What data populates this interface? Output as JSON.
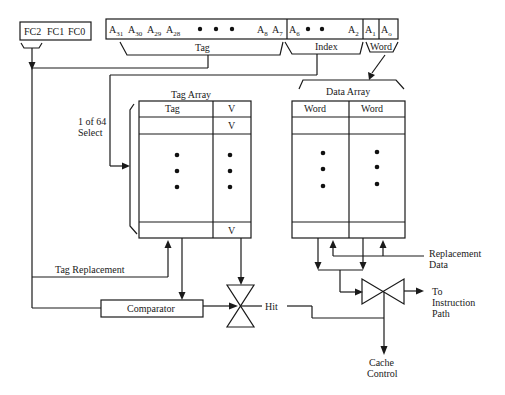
{
  "function_code": {
    "label": "FC2  FC1 FC0",
    "bits": [
      "FC2",
      "FC1",
      "FC0"
    ]
  },
  "address": {
    "tag_bits": {
      "a31": {
        "base": "A",
        "sub": "31"
      },
      "a30": {
        "base": "A",
        "sub": "30"
      },
      "a29": {
        "base": "A",
        "sub": "29"
      },
      "a28": {
        "base": "A",
        "sub": "28"
      },
      "a8": {
        "base": "A",
        "sub": "8"
      },
      "a7": {
        "base": "A",
        "sub": "7"
      }
    },
    "index_bits": {
      "a6": {
        "base": "A",
        "sub": "6"
      },
      "a2": {
        "base": "A",
        "sub": "2"
      }
    },
    "word_bits": {
      "a1": {
        "base": "A",
        "sub": "1"
      },
      "a0": {
        "base": "A",
        "sub": "o"
      }
    },
    "fields": {
      "tag": "Tag",
      "index": "Index",
      "word": "Word"
    }
  },
  "select": {
    "line1": "1 of 64",
    "line2": "Select"
  },
  "tag_array": {
    "title": "Tag Array",
    "col_tag": "Tag",
    "col_valid": "V",
    "row_valid": [
      "V",
      "V"
    ]
  },
  "data_array": {
    "title": "Data Array",
    "col_word1": "Word",
    "col_word2": "Word"
  },
  "signals": {
    "tag_replacement": "Tag Replacement",
    "comparator": "Comparator",
    "hit": "Hit",
    "replacement_data_1": "Replacement",
    "replacement_data_2": "Data",
    "instruction_path_1": "To",
    "instruction_path_2": "Instruction",
    "instruction_path_3": "Path",
    "cache_control_1": "Cache",
    "cache_control_2": "Control"
  }
}
